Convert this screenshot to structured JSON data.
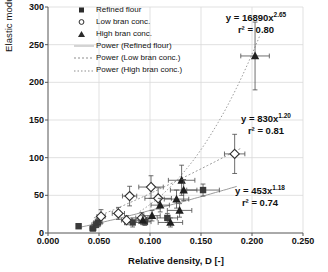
{
  "chart_data": {
    "type": "scatter",
    "title": "",
    "xlabel": "Relative density, D [-]",
    "ylabel": "Elastic modulus, E' [MPa]",
    "xlim": [
      0.0,
      0.25
    ],
    "ylim": [
      0,
      300
    ],
    "xticks": [
      "0.000",
      "0.050",
      "0.100",
      "0.150",
      "0.200",
      "0.250"
    ],
    "yticks": [
      "0",
      "50",
      "100",
      "150",
      "200",
      "250",
      "300"
    ],
    "grid": true,
    "legend_position": "top-left-inside",
    "series": [
      {
        "name": "Refined flour",
        "marker": "filled-square",
        "color": "#3a3a3a",
        "points": [
          {
            "x": 0.03,
            "y": 9,
            "xerr": 0.002,
            "yerr": 3
          },
          {
            "x": 0.044,
            "y": 6,
            "xerr": 0.003,
            "yerr": 3
          },
          {
            "x": 0.047,
            "y": 11,
            "xerr": 0.004,
            "yerr": 4
          },
          {
            "x": 0.049,
            "y": 14,
            "xerr": 0.004,
            "yerr": 5
          },
          {
            "x": 0.083,
            "y": 14,
            "xerr": 0.008,
            "yerr": 6
          },
          {
            "x": 0.095,
            "y": 15,
            "xerr": 0.006,
            "yerr": 5
          },
          {
            "x": 0.117,
            "y": 20,
            "xerr": 0.01,
            "yerr": 6
          },
          {
            "x": 0.152,
            "y": 57,
            "xerr": 0.016,
            "yerr": 8
          }
        ]
      },
      {
        "name": "Low bran conc.",
        "marker": "open-diamond",
        "color": "#2f2f2f",
        "points": [
          {
            "x": 0.052,
            "y": 22,
            "xerr": 0.004,
            "yerr": 9
          },
          {
            "x": 0.069,
            "y": 26,
            "xerr": 0.006,
            "yerr": 8
          },
          {
            "x": 0.077,
            "y": 17,
            "xerr": 0.005,
            "yerr": 6
          },
          {
            "x": 0.08,
            "y": 49,
            "xerr": 0.007,
            "yerr": 13
          },
          {
            "x": 0.092,
            "y": 20,
            "xerr": 0.006,
            "yerr": 7
          },
          {
            "x": 0.101,
            "y": 61,
            "xerr": 0.012,
            "yerr": 15
          },
          {
            "x": 0.108,
            "y": 46,
            "xerr": 0.013,
            "yerr": 14
          },
          {
            "x": 0.183,
            "y": 105,
            "xerr": 0.01,
            "yerr": 26
          }
        ]
      },
      {
        "name": "High bran conc.",
        "marker": "filled-triangle",
        "color": "#1f1f1f",
        "points": [
          {
            "x": 0.093,
            "y": 17,
            "xerr": 0.006,
            "yerr": 6
          },
          {
            "x": 0.102,
            "y": 23,
            "xerr": 0.008,
            "yerr": 7
          },
          {
            "x": 0.11,
            "y": 37,
            "xerr": 0.009,
            "yerr": 9
          },
          {
            "x": 0.12,
            "y": 14,
            "xerr": 0.012,
            "yerr": 6
          },
          {
            "x": 0.126,
            "y": 45,
            "xerr": 0.012,
            "yerr": 12
          },
          {
            "x": 0.129,
            "y": 30,
            "xerr": 0.012,
            "yerr": 9
          },
          {
            "x": 0.131,
            "y": 70,
            "xerr": 0.013,
            "yerr": 20
          },
          {
            "x": 0.133,
            "y": 57,
            "xerr": 0.013,
            "yerr": 14
          },
          {
            "x": 0.203,
            "y": 235,
            "xerr": 0.014,
            "yerr": 45
          }
        ]
      }
    ],
    "trendlines": [
      {
        "name": "Power (Refined flour)",
        "style": "solid-light",
        "equation": "y = 453x",
        "exponent": "1.18",
        "r2": "r² = 0.74",
        "coefficient": 453,
        "power": 1.18,
        "xrange": [
          0.03,
          0.185
        ]
      },
      {
        "name": "Power (Low bran conc.)",
        "style": "dotted",
        "equation": "y = 830x",
        "exponent": "1.20",
        "r2": "r² = 0.81",
        "coefficient": 830,
        "power": 1.2,
        "xrange": [
          0.045,
          0.19
        ]
      },
      {
        "name": "Power (High bran conc.)",
        "style": "dotted-fine",
        "equation": "y = 16890x",
        "exponent": "2.65",
        "r2": "r² = 0.80",
        "coefficient": 16890,
        "power": 2.65,
        "xrange": [
          0.09,
          0.208
        ]
      }
    ],
    "annotations": [
      {
        "id": "eq-high-bran",
        "line1": "y = 16890x",
        "sup": "2.65",
        "line2": "r² = 0.80"
      },
      {
        "id": "eq-low-bran",
        "line1": "y = 830x",
        "sup": "1.20",
        "line2": "r² = 0.81"
      },
      {
        "id": "eq-refined",
        "line1": "y = 453x",
        "sup": "1.18",
        "line2": "r² = 0.74"
      }
    ]
  },
  "legend": {
    "items": [
      {
        "label": "Refined flour",
        "marker": "filled-square"
      },
      {
        "label": "Low bran conc.",
        "marker": "open-circle"
      },
      {
        "label": "High bran conc.",
        "marker": "filled-triangle"
      },
      {
        "label": "Power (Refined flour)",
        "marker": "line-solid"
      },
      {
        "label": "Power (Low bran conc.)",
        "marker": "line-dotted"
      },
      {
        "label": "Power (High bran conc.)",
        "marker": "line-dotted-fine"
      }
    ]
  },
  "colors": {
    "axis": "#555555",
    "grid": "#d9d9d9",
    "marker": "#222222",
    "text": "#111111"
  }
}
